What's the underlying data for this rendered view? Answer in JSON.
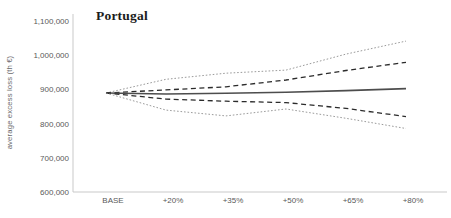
{
  "figure": {
    "title": "Portugal",
    "y_axis_title": "average excess loss (th €)"
  },
  "chart_data": {
    "type": "line",
    "title": "Portugal",
    "xlabel": "",
    "ylabel": "average excess loss (th €)",
    "categories": [
      "BASE",
      "+20%",
      "+35%",
      "+50%",
      "+65%",
      "+80%"
    ],
    "ylim": [
      600000,
      1100000
    ],
    "yticks": [
      1100000,
      1000000,
      900000,
      800000,
      700000,
      600000
    ],
    "ytick_labels": [
      "1,100,000",
      "1,000,000",
      "900,000",
      "800,000",
      "700,000",
      "600,000"
    ],
    "grid": false,
    "legend": "none",
    "axis_color": "#c9c9c9",
    "series": [
      {
        "name": "outer-upper-bound",
        "style": "dotted",
        "color": "#9b9b9b",
        "values": [
          890000,
          930000,
          948000,
          957000,
          1004000,
          1042000
        ]
      },
      {
        "name": "inner-upper-bound",
        "style": "dashed",
        "color": "#2b2b2b",
        "values": [
          890000,
          899000,
          908000,
          928000,
          956000,
          980000
        ]
      },
      {
        "name": "central-estimate",
        "style": "solid",
        "color": "#4d4d4d",
        "values": [
          890000,
          887000,
          889000,
          892000,
          897000,
          903000
        ]
      },
      {
        "name": "inner-lower-bound",
        "style": "dashed",
        "color": "#2b2b2b",
        "values": [
          890000,
          872000,
          866000,
          862000,
          845000,
          821000
        ]
      },
      {
        "name": "outer-lower-bound",
        "style": "dotted",
        "color": "#9b9b9b",
        "values": [
          890000,
          840000,
          823000,
          843000,
          816000,
          786000
        ]
      }
    ]
  }
}
